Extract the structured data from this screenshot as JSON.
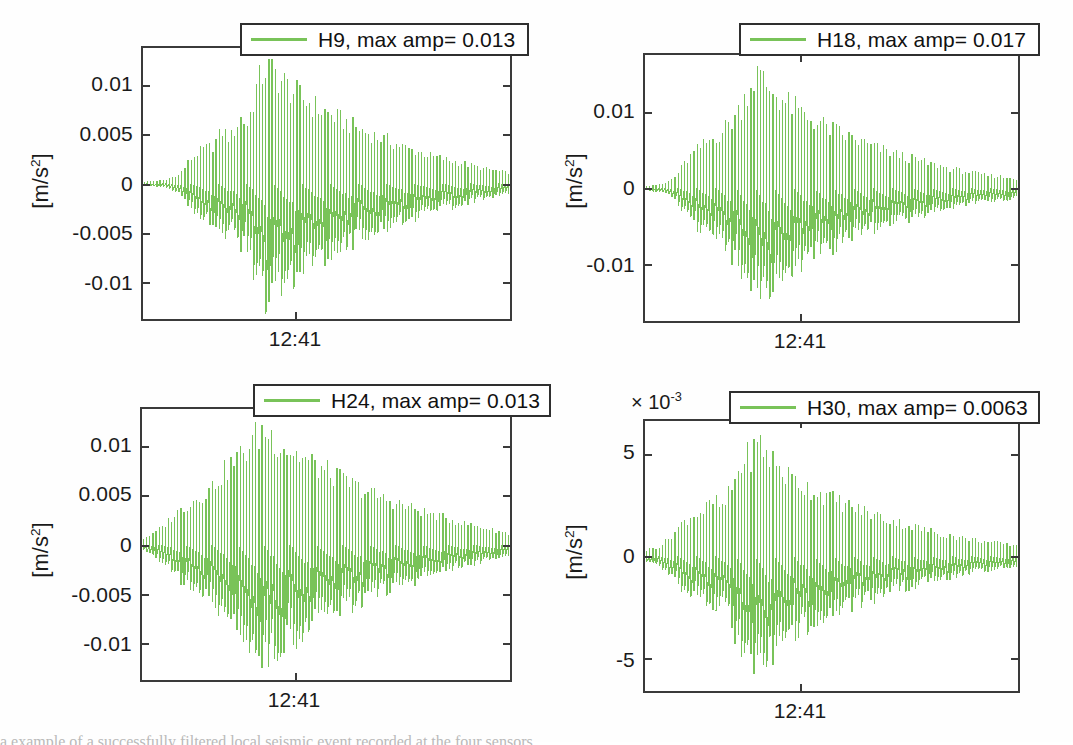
{
  "figure": {
    "width": 1073,
    "height": 742,
    "background": "#ffffff",
    "series_color": "#79c359",
    "axis_color": "#3a3a3a",
    "caption_partial": "a example of a successfully filtered local seismic event recorded at the four sensors"
  },
  "chart_data": [
    {
      "id": "panel-h9",
      "type": "line",
      "title": "",
      "legend": {
        "label": "H9, max amp= 0.013",
        "position": "north"
      },
      "sensor": "H9",
      "max_amp": 0.013,
      "xlabel": "",
      "ylabel": "[m/s2]",
      "ylabel_display": "[m/s",
      "ylabel_exponent": "2",
      "ylabel_tail": "]",
      "yticks": [
        "0.01",
        "0.005",
        "0",
        "-0.005",
        "-0.01"
      ],
      "ytick_values": [
        0.01,
        0.005,
        0,
        -0.005,
        -0.01
      ],
      "ylim": [
        -0.0135,
        0.0135
      ],
      "xticks": [
        "12:41"
      ],
      "xtick_positions": [
        0.415
      ],
      "xlim_label": "time",
      "exponent_label": "",
      "grid": false,
      "envelope_note": "Damped oscillatory seismic burst: onset near x=0.12, peak amplitude ~0.0132 at x=0.34, exponential decay to ~0.0012 at right edge",
      "envelope": [
        {
          "x": 0.0,
          "amp": 0.0002
        },
        {
          "x": 0.06,
          "amp": 0.0004
        },
        {
          "x": 0.1,
          "amp": 0.001
        },
        {
          "x": 0.13,
          "amp": 0.0028
        },
        {
          "x": 0.16,
          "amp": 0.0038
        },
        {
          "x": 0.19,
          "amp": 0.0042
        },
        {
          "x": 0.215,
          "amp": 0.006
        },
        {
          "x": 0.24,
          "amp": 0.0052
        },
        {
          "x": 0.265,
          "amp": 0.0075
        },
        {
          "x": 0.285,
          "amp": 0.0068
        },
        {
          "x": 0.31,
          "amp": 0.011
        },
        {
          "x": 0.335,
          "amp": 0.0132
        },
        {
          "x": 0.36,
          "amp": 0.0125
        },
        {
          "x": 0.39,
          "amp": 0.0112
        },
        {
          "x": 0.43,
          "amp": 0.0098
        },
        {
          "x": 0.48,
          "amp": 0.0085
        },
        {
          "x": 0.54,
          "amp": 0.0072
        },
        {
          "x": 0.6,
          "amp": 0.006
        },
        {
          "x": 0.66,
          "amp": 0.005
        },
        {
          "x": 0.72,
          "amp": 0.004
        },
        {
          "x": 0.79,
          "amp": 0.0031
        },
        {
          "x": 0.86,
          "amp": 0.0024
        },
        {
          "x": 0.93,
          "amp": 0.0017
        },
        {
          "x": 1.0,
          "amp": 0.0012
        }
      ]
    },
    {
      "id": "panel-h18",
      "type": "line",
      "title": "",
      "legend": {
        "label": "H18, max amp= 0.017",
        "position": "north"
      },
      "sensor": "H18",
      "max_amp": 0.017,
      "xlabel": "",
      "ylabel": "[m/s2]",
      "ylabel_display": "[m/s",
      "ylabel_exponent": "2",
      "ylabel_tail": "]",
      "yticks": [
        "0.01",
        "0",
        "-0.01"
      ],
      "ytick_values": [
        0.01,
        0,
        -0.01
      ],
      "ylim": [
        -0.0175,
        0.0175
      ],
      "xticks": [
        "12:41"
      ],
      "xtick_positions": [
        0.415
      ],
      "exponent_label": "",
      "grid": false,
      "envelope_note": "Peak amplitude ~0.0172 near x=0.30, exponential decay to ~0.0014 at right edge",
      "envelope": [
        {
          "x": 0.0,
          "amp": 0.0003
        },
        {
          "x": 0.05,
          "amp": 0.0006
        },
        {
          "x": 0.08,
          "amp": 0.0016
        },
        {
          "x": 0.11,
          "amp": 0.004
        },
        {
          "x": 0.14,
          "amp": 0.0058
        },
        {
          "x": 0.17,
          "amp": 0.007
        },
        {
          "x": 0.2,
          "amp": 0.0082
        },
        {
          "x": 0.23,
          "amp": 0.01
        },
        {
          "x": 0.255,
          "amp": 0.0118
        },
        {
          "x": 0.275,
          "amp": 0.0148
        },
        {
          "x": 0.3,
          "amp": 0.0172
        },
        {
          "x": 0.33,
          "amp": 0.0152
        },
        {
          "x": 0.37,
          "amp": 0.0132
        },
        {
          "x": 0.42,
          "amp": 0.0112
        },
        {
          "x": 0.48,
          "amp": 0.0094
        },
        {
          "x": 0.55,
          "amp": 0.0076
        },
        {
          "x": 0.62,
          "amp": 0.006
        },
        {
          "x": 0.69,
          "amp": 0.0048
        },
        {
          "x": 0.76,
          "amp": 0.0037
        },
        {
          "x": 0.83,
          "amp": 0.0028
        },
        {
          "x": 0.9,
          "amp": 0.0021
        },
        {
          "x": 1.0,
          "amp": 0.0014
        }
      ]
    },
    {
      "id": "panel-h24",
      "type": "line",
      "title": "",
      "legend": {
        "label": "H24, max amp= 0.013",
        "position": "north"
      },
      "sensor": "H24",
      "max_amp": 0.013,
      "xlabel": "",
      "ylabel": "[m/s2]",
      "ylabel_display": "[m/s",
      "ylabel_exponent": "2",
      "ylabel_tail": "]",
      "yticks": [
        "0.01",
        "0.005",
        "0",
        "-0.005",
        "-0.01"
      ],
      "ytick_values": [
        0.01,
        0.005,
        0,
        -0.005,
        -0.01
      ],
      "ylim": [
        -0.0138,
        0.0138
      ],
      "xticks": [
        "12:41"
      ],
      "xtick_positions": [
        0.415
      ],
      "exponent_label": "",
      "grid": false,
      "envelope_note": "Peak amplitude ~0.0134 near x=0.33, decay to ~0.0013 at right edge",
      "envelope": [
        {
          "x": 0.0,
          "amp": 0.0006
        },
        {
          "x": 0.03,
          "amp": 0.0012
        },
        {
          "x": 0.06,
          "amp": 0.0022
        },
        {
          "x": 0.09,
          "amp": 0.0035
        },
        {
          "x": 0.12,
          "amp": 0.0046
        },
        {
          "x": 0.15,
          "amp": 0.0054
        },
        {
          "x": 0.18,
          "amp": 0.0062
        },
        {
          "x": 0.21,
          "amp": 0.0078
        },
        {
          "x": 0.24,
          "amp": 0.0092
        },
        {
          "x": 0.27,
          "amp": 0.0104
        },
        {
          "x": 0.3,
          "amp": 0.012
        },
        {
          "x": 0.33,
          "amp": 0.0134
        },
        {
          "x": 0.365,
          "amp": 0.0122
        },
        {
          "x": 0.41,
          "amp": 0.0108
        },
        {
          "x": 0.47,
          "amp": 0.0092
        },
        {
          "x": 0.54,
          "amp": 0.0076
        },
        {
          "x": 0.61,
          "amp": 0.0062
        },
        {
          "x": 0.68,
          "amp": 0.005
        },
        {
          "x": 0.75,
          "amp": 0.004
        },
        {
          "x": 0.82,
          "amp": 0.0031
        },
        {
          "x": 0.9,
          "amp": 0.0022
        },
        {
          "x": 1.0,
          "amp": 0.0013
        }
      ]
    },
    {
      "id": "panel-h30",
      "type": "line",
      "title": "",
      "legend": {
        "label": "H30, max amp= 0.0063",
        "position": "north"
      },
      "sensor": "H30",
      "max_amp": 0.0063,
      "xlabel": "",
      "ylabel": "[m/s2]",
      "ylabel_display": "[m/s",
      "ylabel_exponent": "2",
      "ylabel_tail": "]",
      "yticks": [
        "5",
        "0",
        "-5"
      ],
      "ytick_values": [
        5,
        0,
        -5
      ],
      "ylim": [
        -6.6,
        6.6
      ],
      "xticks": [
        "12:41"
      ],
      "xtick_positions": [
        0.415
      ],
      "exponent_label": "×10-3",
      "exponent_mantissa": "× 10",
      "exponent_power": "-3",
      "y_scale_factor": 0.001,
      "grid": false,
      "envelope_note": "Values in units of 1e-3 m/s^2. Peak ~6.3e-3 near x=0.31, decay to ~0.6e-3 at right edge",
      "envelope": [
        {
          "x": 0.0,
          "amp": 0.3
        },
        {
          "x": 0.04,
          "amp": 0.55
        },
        {
          "x": 0.07,
          "amp": 1.1
        },
        {
          "x": 0.1,
          "amp": 1.85
        },
        {
          "x": 0.13,
          "amp": 2.3
        },
        {
          "x": 0.16,
          "amp": 2.55
        },
        {
          "x": 0.185,
          "amp": 3.05
        },
        {
          "x": 0.21,
          "amp": 2.6
        },
        {
          "x": 0.235,
          "amp": 3.95
        },
        {
          "x": 0.26,
          "amp": 5.2
        },
        {
          "x": 0.285,
          "amp": 5.7
        },
        {
          "x": 0.31,
          "amp": 6.3
        },
        {
          "x": 0.34,
          "amp": 5.4
        },
        {
          "x": 0.38,
          "amp": 4.5
        },
        {
          "x": 0.43,
          "amp": 3.9
        },
        {
          "x": 0.49,
          "amp": 3.3
        },
        {
          "x": 0.56,
          "amp": 2.7
        },
        {
          "x": 0.63,
          "amp": 2.2
        },
        {
          "x": 0.7,
          "amp": 1.75
        },
        {
          "x": 0.77,
          "amp": 1.35
        },
        {
          "x": 0.85,
          "amp": 1.0
        },
        {
          "x": 0.93,
          "amp": 0.75
        },
        {
          "x": 1.0,
          "amp": 0.6
        }
      ]
    }
  ]
}
